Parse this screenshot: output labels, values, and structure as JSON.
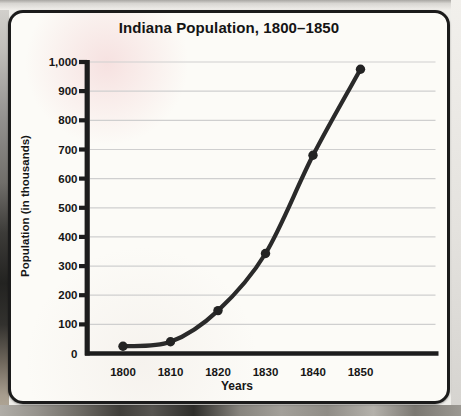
{
  "chart": {
    "title": "Indiana Population, 1800–1850",
    "xlabel": "Years",
    "ylabel": "Population (in thousands)"
  },
  "chart_data": {
    "type": "line",
    "title": "Indiana Population, 1800–1850",
    "xlabel": "Years",
    "ylabel": "Population (in thousands)",
    "categories": [
      "1800",
      "1810",
      "1820",
      "1830",
      "1840",
      "1850"
    ],
    "series": [
      {
        "name": "Indiana population (in thousands)",
        "values": [
          25,
          40,
          147,
          343,
          680,
          975
        ]
      }
    ],
    "ylim": [
      0,
      1000
    ],
    "ytick_step": 100,
    "ytick_labels": [
      "0",
      "100",
      "200",
      "300",
      "400",
      "500",
      "600",
      "700",
      "800",
      "900",
      "1,000"
    ],
    "grid": true,
    "legend": false,
    "marker": "circle"
  },
  "colors": {
    "line": "#2a2a2a",
    "marker": "#232323",
    "axis": "#1d1d1d",
    "gridline": "#cfcfcf",
    "card_background": "#fcfbf7",
    "card_border": "#1b1b1b",
    "text": "#161616"
  }
}
